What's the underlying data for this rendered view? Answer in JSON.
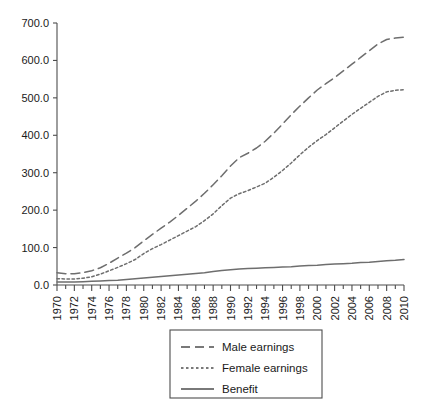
{
  "chart_data": {
    "type": "line",
    "title": "",
    "subtitle": "",
    "xlabel": "",
    "ylabel": "",
    "xlim": [
      1970,
      2010
    ],
    "ylim": [
      0,
      700
    ],
    "grid": false,
    "legend_position": "bottom-center",
    "y_ticks": [
      "0.0",
      "100.0",
      "200.0",
      "300.0",
      "400.0",
      "500.0",
      "600.0",
      "700.0"
    ],
    "y_tick_values": [
      0,
      100,
      200,
      300,
      400,
      500,
      600,
      700
    ],
    "x_tick_labels": [
      "1970",
      "1972",
      "1974",
      "1976",
      "1978",
      "1980",
      "1982",
      "1984",
      "1986",
      "1988",
      "1990",
      "1992",
      "1994",
      "1996",
      "1998",
      "2000",
      "2002",
      "2004",
      "2006",
      "2008",
      "2010"
    ],
    "x_tick_values": [
      1970,
      1972,
      1974,
      1976,
      1978,
      1980,
      1982,
      1984,
      1986,
      1988,
      1990,
      1992,
      1994,
      1996,
      1998,
      2000,
      2002,
      2004,
      2006,
      2008,
      2010
    ],
    "x_minor_ticks_every": 1,
    "x": [
      1970,
      1971,
      1972,
      1973,
      1974,
      1975,
      1976,
      1977,
      1978,
      1979,
      1980,
      1981,
      1982,
      1983,
      1984,
      1985,
      1986,
      1987,
      1988,
      1989,
      1990,
      1991,
      1992,
      1993,
      1994,
      1995,
      1996,
      1997,
      1998,
      1999,
      2000,
      2001,
      2002,
      2003,
      2004,
      2005,
      2006,
      2007,
      2008,
      2009,
      2010
    ],
    "series": [
      {
        "name": "Male earnings",
        "style": "dashed",
        "color": "#6e6e6e",
        "values": [
          33,
          30,
          30,
          33,
          38,
          46,
          58,
          72,
          85,
          100,
          118,
          135,
          152,
          168,
          186,
          205,
          224,
          245,
          268,
          292,
          318,
          340,
          352,
          366,
          384,
          406,
          430,
          455,
          478,
          500,
          521,
          538,
          554,
          572,
          590,
          608,
          626,
          644,
          656,
          660,
          662
        ]
      },
      {
        "name": "Female earnings",
        "style": "dotted",
        "color": "#6e6e6e",
        "values": [
          17,
          16,
          16,
          18,
          22,
          29,
          38,
          47,
          57,
          68,
          84,
          97,
          108,
          120,
          132,
          144,
          156,
          172,
          190,
          212,
          232,
          244,
          252,
          262,
          272,
          288,
          306,
          326,
          348,
          368,
          386,
          402,
          420,
          438,
          456,
          472,
          488,
          504,
          516,
          520,
          522
        ]
      },
      {
        "name": "Benefit",
        "style": "solid",
        "color": "#6e6e6e",
        "values": [
          8,
          8,
          8,
          9,
          10,
          11,
          12,
          13,
          15,
          17,
          19,
          21,
          23,
          25,
          27,
          29,
          31,
          33,
          36,
          39,
          41,
          43,
          44,
          45,
          46,
          47,
          48,
          49,
          51,
          52,
          53,
          55,
          56,
          57,
          58,
          60,
          61,
          63,
          65,
          66,
          68
        ]
      }
    ],
    "legend": [
      {
        "label": "Male earnings",
        "style": "dashed"
      },
      {
        "label": "Female earnings",
        "style": "dotted"
      },
      {
        "label": "Benefit",
        "style": "solid"
      }
    ]
  }
}
